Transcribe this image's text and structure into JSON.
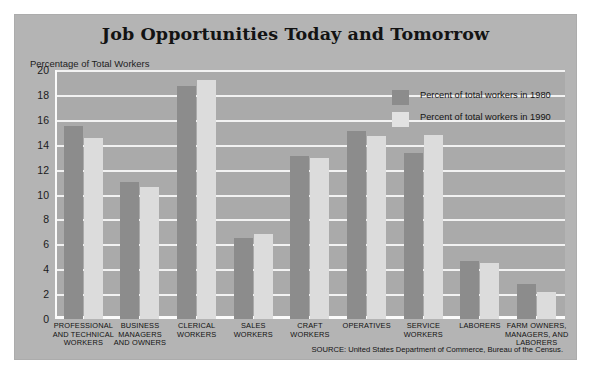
{
  "chart_data": {
    "type": "bar",
    "title": "Job Opportunities Today and Tomorrow",
    "ylabel": "Percentage of Total Workers",
    "xlabel": "",
    "ylim": [
      0,
      20
    ],
    "ytick_step": 2,
    "yticks": [
      0,
      2,
      4,
      6,
      8,
      10,
      12,
      14,
      16,
      18,
      20
    ],
    "grid": true,
    "legend_position": "top-right",
    "categories": [
      "PROFESSIONAL AND TECHNICAL WORKERS",
      "BUSINESS MANAGERS AND OWNERS",
      "CLERICAL WORKERS",
      "SALES WORKERS",
      "CRAFT WORKERS",
      "OPERATIVES",
      "SERVICE WORKERS",
      "LABORERS",
      "FARM OWNERS, MANAGERS, AND LABORERS"
    ],
    "category_lines": [
      [
        "PROFESSIONAL",
        "AND TECHNICAL",
        "WORKERS"
      ],
      [
        "BUSINESS",
        "MANAGERS",
        "AND OWNERS"
      ],
      [
        "CLERICAL",
        "WORKERS"
      ],
      [
        "SALES",
        "WORKERS"
      ],
      [
        "CRAFT",
        "WORKERS"
      ],
      [
        "OPERATIVES"
      ],
      [
        "SERVICE",
        "WORKERS"
      ],
      [
        "LABORERS"
      ],
      [
        "FARM OWNERS,",
        "MANAGERS, AND",
        "LABORERS"
      ]
    ],
    "series": [
      {
        "name": "Percent of total workers  in 1980",
        "color": "#8c8c8c",
        "values": [
          15.5,
          11.0,
          18.7,
          6.5,
          13.1,
          15.1,
          13.3,
          4.7,
          2.8
        ]
      },
      {
        "name": "Percent of total workers  in 1990",
        "color": "#dcdcdc",
        "values": [
          14.5,
          10.6,
          19.2,
          6.8,
          12.9,
          14.7,
          14.8,
          4.5,
          2.2
        ]
      }
    ],
    "source": "SOURCE: United States Department of Commerce, Bureau of the Census."
  },
  "legend": {
    "items": [
      {
        "label": "Percent of total workers  in 1980",
        "swatch": "#8c8c8c"
      },
      {
        "label": "Percent of total workers  in 1990",
        "swatch": "#e2e2e2"
      }
    ]
  },
  "colors": {
    "panel_background": "#b4b4b4",
    "plot_background": "#aaaaaa",
    "gridline": "#f2f2f2",
    "bar_1980": "#8c8c8c",
    "bar_1990": "#dcdcdc",
    "text": "#131313"
  }
}
